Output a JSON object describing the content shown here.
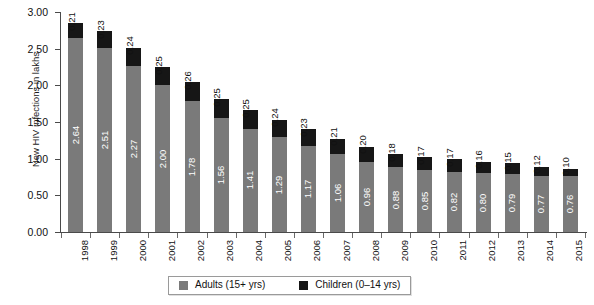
{
  "chart_data": {
    "type": "bar",
    "stacked": true,
    "title": "",
    "xlabel": "",
    "ylabel": "New HIV infections in lakhs",
    "ylim": [
      0.0,
      3.0
    ],
    "ytick_labels": [
      "3.00",
      "2.50",
      "2.00",
      "1.50",
      "1.00",
      "0.50",
      "0.00"
    ],
    "ytick_values": [
      3.0,
      2.5,
      2.0,
      1.5,
      1.0,
      0.5,
      0.0
    ],
    "grid": false,
    "legend_position": "bottom-center",
    "categories": [
      "1998",
      "1999",
      "2000",
      "2001",
      "2002",
      "2003",
      "2004",
      "2005",
      "2006",
      "2007",
      "2008",
      "2009",
      "2010",
      "2011",
      "2012",
      "2013",
      "2014",
      "2015"
    ],
    "series": [
      {
        "name": "Adults (15+ yrs)",
        "color": "#7a7a7a",
        "values": [
          2.64,
          2.51,
          2.27,
          2.0,
          1.78,
          1.56,
          1.41,
          1.29,
          1.17,
          1.06,
          0.96,
          0.88,
          0.85,
          0.82,
          0.8,
          0.79,
          0.77,
          0.76
        ],
        "labels": [
          "2.64",
          "2.51",
          "2.27",
          "2.00",
          "1.78",
          "1.56",
          "1.41",
          "1.29",
          "1.17",
          "1.06",
          "0.96",
          "0.88",
          "0.85",
          "0.82",
          "0.80",
          "0.79",
          "0.77",
          "0.76"
        ]
      },
      {
        "name": "Children (0–14 yrs)",
        "color": "#161616",
        "values": [
          0.21,
          0.23,
          0.24,
          0.25,
          0.26,
          0.25,
          0.25,
          0.24,
          0.23,
          0.21,
          0.2,
          0.18,
          0.17,
          0.17,
          0.16,
          0.15,
          0.12,
          0.1
        ],
        "labels": [
          "0.21",
          "0.23",
          "0.24",
          "0.25",
          "0.26",
          "0.25",
          "0.25",
          "0.24",
          "0.23",
          "0.21",
          "0.20",
          "0.18",
          "0.17",
          "0.17",
          "0.16",
          "0.15",
          "0.12",
          "0.10"
        ]
      }
    ]
  },
  "axis": {
    "y_title": "New HIV infections in lakhs"
  },
  "legend": {
    "items": [
      {
        "label": "Adults (15+ yrs)",
        "color": "#7a7a7a"
      },
      {
        "label": "Children (0–14 yrs)",
        "color": "#161616"
      }
    ]
  }
}
